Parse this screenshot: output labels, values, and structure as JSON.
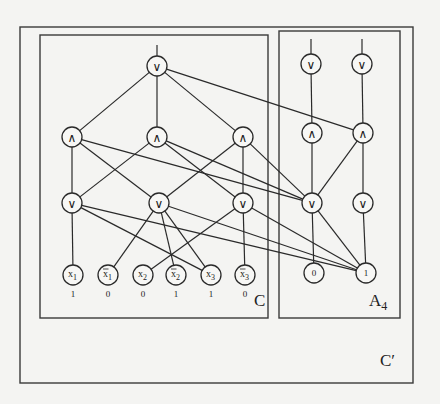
{
  "boxes": [
    {
      "id": "C_prime",
      "label": "C′",
      "x": 20,
      "y": 27,
      "w": 393,
      "h": 356,
      "label_x": 380,
      "label_y": 366
    },
    {
      "id": "C",
      "label": "C",
      "x": 40,
      "y": 35,
      "w": 228,
      "h": 283,
      "label_x": 254,
      "label_y": 306
    },
    {
      "id": "A4",
      "label": "A",
      "sub": "4",
      "x": 279,
      "y": 31,
      "w": 121,
      "h": 287,
      "label_x": 369,
      "label_y": 306
    }
  ],
  "nodes": [
    {
      "id": "c_or_top",
      "op": "∨",
      "x": 157,
      "y": 66
    },
    {
      "id": "c_and_1",
      "op": "∧",
      "x": 72,
      "y": 137
    },
    {
      "id": "c_and_2",
      "op": "∧",
      "x": 157,
      "y": 137
    },
    {
      "id": "c_and_3",
      "op": "∧",
      "x": 243,
      "y": 137
    },
    {
      "id": "c_or_1",
      "op": "∨",
      "x": 72,
      "y": 203
    },
    {
      "id": "c_or_2",
      "op": "∨",
      "x": 159,
      "y": 203
    },
    {
      "id": "c_or_3",
      "op": "∨",
      "x": 243,
      "y": 203
    },
    {
      "id": "a_or_top_l",
      "op": "∨",
      "x": 311,
      "y": 64
    },
    {
      "id": "a_or_top_r",
      "op": "∨",
      "x": 362,
      "y": 64
    },
    {
      "id": "a_and_l",
      "op": "∧",
      "x": 312,
      "y": 133
    },
    {
      "id": "a_and_r",
      "op": "∧",
      "x": 363,
      "y": 133
    },
    {
      "id": "a_or_l",
      "op": "∨",
      "x": 312,
      "y": 203
    },
    {
      "id": "a_or_r",
      "op": "∨",
      "x": 363,
      "y": 203
    }
  ],
  "inputs": [
    {
      "id": "x1",
      "name": "x",
      "sub": "1",
      "negated": false,
      "x": 73,
      "y": 275,
      "value": "1"
    },
    {
      "id": "nx1",
      "name": "x",
      "sub": "1",
      "negated": true,
      "x": 108,
      "y": 275,
      "value": "0"
    },
    {
      "id": "x2",
      "name": "x",
      "sub": "2",
      "negated": false,
      "x": 143,
      "y": 275,
      "value": "0"
    },
    {
      "id": "nx2",
      "name": "x",
      "sub": "2",
      "negated": true,
      "x": 176,
      "y": 275,
      "value": "1"
    },
    {
      "id": "x3",
      "name": "x",
      "sub": "3",
      "negated": false,
      "x": 211,
      "y": 275,
      "value": "1"
    },
    {
      "id": "nx3",
      "name": "x",
      "sub": "3",
      "negated": true,
      "x": 245,
      "y": 275,
      "value": "0"
    }
  ],
  "constants": [
    {
      "id": "const0",
      "label": "0",
      "x": 314,
      "y": 273
    },
    {
      "id": "const1",
      "label": "1",
      "x": 366,
      "y": 273
    }
  ],
  "stubs": [
    {
      "x": 157,
      "y1": 45,
      "y2": 56
    },
    {
      "x": 311,
      "y1": 39,
      "y2": 54
    },
    {
      "x": 362,
      "y1": 39,
      "y2": 54
    }
  ],
  "edges": [
    [
      "c_or_top",
      "c_and_1"
    ],
    [
      "c_or_top",
      "c_and_2"
    ],
    [
      "c_or_top",
      "c_and_3"
    ],
    [
      "c_or_top",
      "a_and_r"
    ],
    [
      "c_and_1",
      "c_or_1"
    ],
    [
      "c_and_1",
      "c_or_2"
    ],
    [
      "c_and_1",
      "a_or_l"
    ],
    [
      "c_and_2",
      "c_or_1"
    ],
    [
      "c_and_2",
      "c_or_3"
    ],
    [
      "c_and_2",
      "a_or_l"
    ],
    [
      "c_and_3",
      "c_or_2"
    ],
    [
      "c_and_3",
      "c_or_3"
    ],
    [
      "c_and_3",
      "a_or_l"
    ],
    [
      "c_or_1",
      "x1"
    ],
    [
      "c_or_1",
      "x3"
    ],
    [
      "c_or_1",
      "const1"
    ],
    [
      "c_or_2",
      "nx1"
    ],
    [
      "c_or_2",
      "nx2"
    ],
    [
      "c_or_2",
      "x3"
    ],
    [
      "c_or_2",
      "const1"
    ],
    [
      "c_or_3",
      "x2"
    ],
    [
      "c_or_3",
      "nx3"
    ],
    [
      "c_or_3",
      "const1"
    ],
    [
      "a_or_top_l",
      "a_and_l"
    ],
    [
      "a_or_top_r",
      "a_and_r"
    ],
    [
      "a_and_l",
      "a_or_l"
    ],
    [
      "a_and_r",
      "a_or_l"
    ],
    [
      "a_and_r",
      "a_or_r"
    ],
    [
      "a_or_l",
      "const0"
    ],
    [
      "a_or_l",
      "const1"
    ],
    [
      "a_or_r",
      "const1"
    ]
  ],
  "node_radius": 10
}
